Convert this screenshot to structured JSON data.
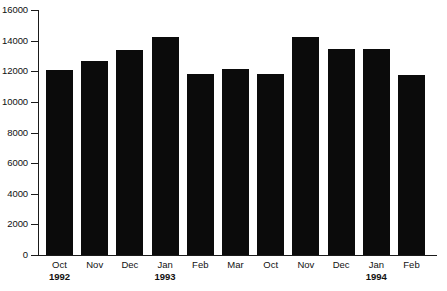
{
  "chart_data": {
    "type": "bar",
    "title": "",
    "xlabel": "",
    "ylabel": "",
    "ylim": [
      0,
      16000
    ],
    "grid": false,
    "legend": null,
    "bar_color": "#0b0b0b",
    "axis_color": "#1a1a1a",
    "y_ticks": [
      0,
      2000,
      4000,
      6000,
      8000,
      10000,
      12000,
      14000,
      16000
    ],
    "y_tick_labels": [
      "0",
      "2000",
      "4000",
      "6000",
      "8000",
      "10000",
      "12000",
      "14000",
      "16000"
    ],
    "categories": [
      {
        "month": "Oct",
        "year": "1992"
      },
      {
        "month": "Nov",
        "year": ""
      },
      {
        "month": "Dec",
        "year": ""
      },
      {
        "month": "Jan",
        "year": "1993"
      },
      {
        "month": "Feb",
        "year": ""
      },
      {
        "month": "Mar",
        "year": ""
      },
      {
        "month": "Oct",
        "year": ""
      },
      {
        "month": "Nov",
        "year": ""
      },
      {
        "month": "Dec",
        "year": ""
      },
      {
        "month": "Jan",
        "year": "1994"
      },
      {
        "month": "Feb",
        "year": ""
      }
    ],
    "values": [
      12100,
      12650,
      13400,
      14250,
      11800,
      12150,
      11800,
      14250,
      13450,
      13450,
      11750
    ]
  }
}
